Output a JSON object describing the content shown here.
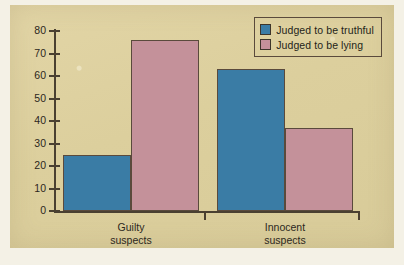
{
  "chart_data": {
    "type": "bar",
    "title": "",
    "subtitle": "",
    "xlabel": "",
    "ylabel": "",
    "ylim": [
      0,
      80
    ],
    "yticks": [
      0,
      10,
      20,
      30,
      40,
      50,
      60,
      70,
      80
    ],
    "ytick_labels": [
      "0",
      "10",
      "20",
      "30",
      "40",
      "50",
      "60",
      "70",
      "80"
    ],
    "grid": false,
    "legend_position": "top-right",
    "categories": [
      "Guilty suspects",
      "Innocent suspects"
    ],
    "category_lines": [
      [
        "Guilty",
        "suspects"
      ],
      [
        "Innocent",
        "suspects"
      ]
    ],
    "series": [
      {
        "name": "Judged to be truthful",
        "color": "#3a7ca5",
        "values": [
          25,
          63
        ]
      },
      {
        "name": "Judged to be lying",
        "color": "#c4919a",
        "values": [
          76,
          37
        ]
      }
    ],
    "annotations": []
  },
  "legend": {
    "items": [
      {
        "label": "Judged to be truthful",
        "swatch": "truthful"
      },
      {
        "label": "Judged to be lying",
        "swatch": "lying"
      }
    ]
  },
  "colors": {
    "panel_background": "#ddd0a0",
    "page_background": "#f4f1e6",
    "axis": "#4a4031",
    "text": "#2b2720",
    "truthful": "#3a7ca5",
    "lying": "#c4919a"
  }
}
